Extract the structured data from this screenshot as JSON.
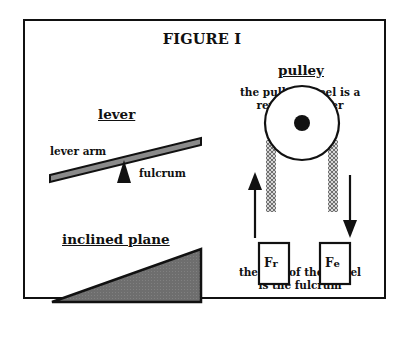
{
  "figure": {
    "title": "FIGURE I",
    "lever": {
      "heading": "lever",
      "arm_label": "lever arm",
      "fulcrum_label": "fulcrum"
    },
    "inclined_plane": {
      "heading": "inclined plane"
    },
    "pulley": {
      "heading": "pulley",
      "caption_line1": "the pulley wheel is a",
      "caption_line2": "revolving lever",
      "weight_left": "F",
      "weight_left_sub": "r",
      "weight_right": "F",
      "weight_right_sub": "e",
      "footer_line1": "the axle of the wheel",
      "footer_line2": "is the fulcrum"
    },
    "colors": {
      "ink": "#111111",
      "fill_gray": "#707070",
      "lever_gray": "#8a8a8a",
      "rope_gray": "#9a9a9a"
    }
  }
}
